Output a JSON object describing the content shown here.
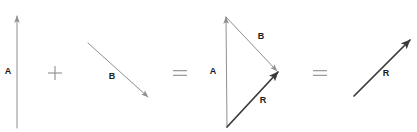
{
  "figure": {
    "width": 417,
    "height": 132,
    "background": "#ffffff"
  },
  "colors": {
    "thin_vector": "#8f8f8f",
    "resultant_vector": "#3a3a3a",
    "label_text": "#1a1a1a",
    "operator": "#8c8c8c"
  },
  "operators": [
    {
      "name": "plus",
      "symbol": "+",
      "x": 55,
      "y": 73
    },
    {
      "name": "equals-1",
      "symbol": "=",
      "x": 180,
      "y": 73
    },
    {
      "name": "equals-2",
      "symbol": "=",
      "x": 320,
      "y": 73
    }
  ],
  "groups": [
    {
      "id": "term-a",
      "caption": "Vector A alone",
      "vectors": [
        {
          "id": "a-standalone",
          "label": "A",
          "style": "thin",
          "x1": 17,
          "y1": 128,
          "x2": 17,
          "y2": 16,
          "label_x": 8,
          "label_y": 72
        }
      ]
    },
    {
      "id": "term-b",
      "caption": "Vector B alone",
      "vectors": [
        {
          "id": "b-standalone",
          "label": "B",
          "style": "thin",
          "x1": 88,
          "y1": 43,
          "x2": 148,
          "y2": 97,
          "label_x": 112,
          "label_y": 77
        }
      ]
    },
    {
      "id": "triangle",
      "caption": "Head-to-tail triangle construction",
      "vectors": [
        {
          "id": "a-triangle",
          "label": "A",
          "style": "thin",
          "x1": 227,
          "y1": 127,
          "x2": 226,
          "y2": 17,
          "label_x": 213,
          "label_y": 72
        },
        {
          "id": "b-triangle",
          "label": "B",
          "style": "thin",
          "x1": 226,
          "y1": 17,
          "x2": 277,
          "y2": 71,
          "label_x": 261,
          "label_y": 37
        },
        {
          "id": "r-triangle",
          "label": "R",
          "style": "bold",
          "x1": 227,
          "y1": 127,
          "x2": 278,
          "y2": 72,
          "label_x": 263,
          "label_y": 101
        }
      ]
    },
    {
      "id": "result",
      "caption": "Resultant vector R",
      "vectors": [
        {
          "id": "r-standalone",
          "label": "R",
          "style": "bold",
          "x1": 354,
          "y1": 96,
          "x2": 410,
          "y2": 40,
          "label_x": 386,
          "label_y": 74
        }
      ]
    }
  ]
}
